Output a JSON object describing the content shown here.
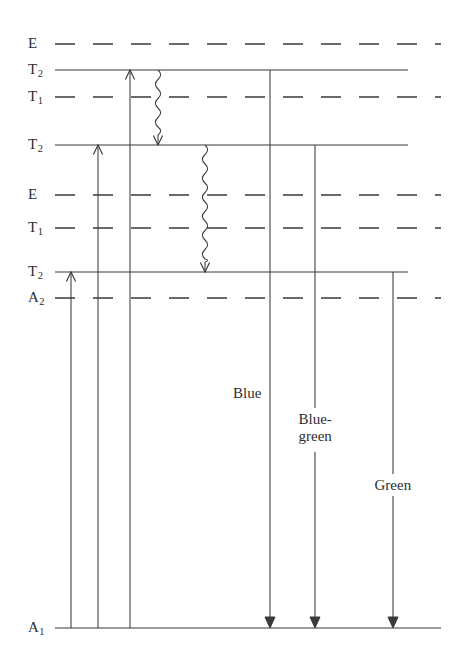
{
  "diagram": {
    "background_color": "#ffffff",
    "line_color": "#3a3a3a",
    "text_color": "#2e2e2e",
    "levels": [
      {
        "id": "e-top",
        "base": "E",
        "sub": "",
        "label": "E",
        "y": 44,
        "style": "dashed",
        "x1": 55,
        "x2": 441
      },
      {
        "id": "t2-top",
        "base": "T",
        "sub": "2",
        "label": "T2",
        "y": 70,
        "style": "solid",
        "x1": 55,
        "x2": 408
      },
      {
        "id": "t1-upper",
        "base": "T",
        "sub": "1",
        "label": "T1",
        "y": 97,
        "style": "dashed",
        "x1": 55,
        "x2": 441
      },
      {
        "id": "t2-mid",
        "base": "T",
        "sub": "2",
        "label": "T2",
        "y": 145,
        "style": "solid",
        "x1": 55,
        "x2": 408
      },
      {
        "id": "e-mid",
        "base": "E",
        "sub": "",
        "label": "E",
        "y": 195,
        "style": "dashed",
        "x1": 55,
        "x2": 441
      },
      {
        "id": "t1-lower",
        "base": "T",
        "sub": "1",
        "label": "T1",
        "y": 228,
        "style": "dashed",
        "x1": 55,
        "x2": 441
      },
      {
        "id": "t2-low",
        "base": "T",
        "sub": "2",
        "label": "T2",
        "y": 272,
        "style": "solid",
        "x1": 55,
        "x2": 408
      },
      {
        "id": "a2",
        "base": "A",
        "sub": "2",
        "label": "A2",
        "y": 298,
        "style": "dashed",
        "x1": 55,
        "x2": 441
      },
      {
        "id": "a1-ground",
        "base": "A",
        "sub": "1",
        "label": "A1",
        "y": 628,
        "style": "solid",
        "x1": 55,
        "x2": 441
      }
    ],
    "label_x": 28,
    "absorptions": [
      {
        "id": "absorption-green",
        "x": 71,
        "from_y": 628,
        "to_y": 272,
        "direction": "up"
      },
      {
        "id": "absorption-bluegreen",
        "x": 98,
        "from_y": 628,
        "to_y": 145,
        "direction": "up"
      },
      {
        "id": "absorption-blue",
        "x": 130,
        "from_y": 628,
        "to_y": 70,
        "direction": "up"
      }
    ],
    "relaxations": [
      {
        "id": "relaxation-upper",
        "x": 158,
        "from_y": 70,
        "to_y": 145,
        "style": "wavy"
      },
      {
        "id": "relaxation-lower",
        "x": 205,
        "from_y": 145,
        "to_y": 272,
        "style": "wavy"
      }
    ],
    "emissions": [
      {
        "id": "emission-blue",
        "label": "Blue",
        "label_lines": [
          "Blue"
        ],
        "x": 270,
        "from_y": 70,
        "to_y": 628,
        "label_y": 396,
        "label_side": "left"
      },
      {
        "id": "emission-bluegreen",
        "label": "Blue-green",
        "label_lines": [
          "Blue-",
          "green"
        ],
        "x": 315,
        "from_y": 145,
        "to_y": 628,
        "label_y": 422,
        "label_side": "right"
      },
      {
        "id": "emission-green",
        "label": "Green",
        "label_lines": [
          "Green"
        ],
        "x": 393,
        "from_y": 272,
        "to_y": 628,
        "label_y": 488,
        "label_side": "right"
      }
    ]
  }
}
